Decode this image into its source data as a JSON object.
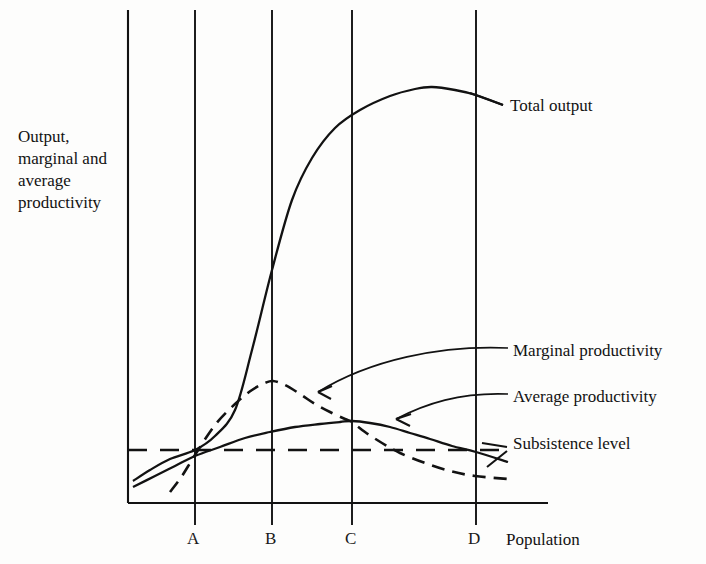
{
  "figure": {
    "axis_y_label": "Output,\nmarginal and\naverage\nproductivity",
    "axis_x_label": "Population",
    "background_color": "#fdfdfc",
    "ink_color": "#121212"
  },
  "labels": {
    "total_output": "Total output",
    "marginal_productivity": "Marginal productivity",
    "average_productivity": "Average productivity",
    "subsistence_level": "Subsistence level"
  },
  "ticks": {
    "a": "A",
    "b": "B",
    "c": "C",
    "d": "D"
  },
  "chart_data": {
    "type": "line",
    "title": "",
    "xlabel": "Population",
    "ylabel": "Output, marginal and average productivity",
    "grid": true,
    "legend": "right-inline-callouts",
    "x_tick_labels": [
      "A",
      "B",
      "C",
      "D"
    ],
    "x_tick_pixels": [
      195,
      272,
      352,
      476
    ],
    "y_tick_labels": [],
    "axis_origin_px": [
      128,
      503
    ],
    "axis_x_end_px": [
      548,
      503
    ],
    "axis_y_top_px": [
      128,
      10
    ],
    "annotations": [
      {
        "text": "Total output",
        "anchor_px": [
          503,
          105
        ]
      },
      {
        "text": "Marginal productivity",
        "anchor_px": [
          313,
          393
        ]
      },
      {
        "text": "Average productivity",
        "anchor_px": [
          392,
          420
        ]
      },
      {
        "text": "Subsistence level",
        "anchor_px": [
          505,
          450
        ]
      }
    ],
    "series": [
      {
        "name": "Total output",
        "style": "solid",
        "description": "S-shaped curve: rises slowly, inflects at B, peaks just before D, then declines",
        "points": [
          [
            133,
            481
          ],
          [
            150,
            470
          ],
          [
            170,
            459
          ],
          [
            195,
            450
          ],
          [
            215,
            436
          ],
          [
            235,
            410
          ],
          [
            252,
            350
          ],
          [
            272,
            270
          ],
          [
            292,
            200
          ],
          [
            312,
            158
          ],
          [
            335,
            128
          ],
          [
            360,
            110
          ],
          [
            390,
            96
          ],
          [
            415,
            89
          ],
          [
            432,
            87
          ],
          [
            455,
            90
          ],
          [
            476,
            95
          ],
          [
            503,
            105
          ]
        ]
      },
      {
        "name": "Marginal productivity",
        "style": "dashed",
        "description": "Rises steeply from below subsistence, peaks at B, falls and crosses Average at C, continues down",
        "points": [
          [
            170,
            492
          ],
          [
            182,
            476
          ],
          [
            195,
            455
          ],
          [
            215,
            425
          ],
          [
            235,
            404
          ],
          [
            252,
            390
          ],
          [
            265,
            383
          ],
          [
            273,
            381
          ],
          [
            285,
            385
          ],
          [
            300,
            394
          ],
          [
            315,
            404
          ],
          [
            330,
            412
          ],
          [
            345,
            419
          ],
          [
            352,
            422
          ],
          [
            365,
            432
          ],
          [
            382,
            443
          ],
          [
            400,
            453
          ],
          [
            425,
            463
          ],
          [
            450,
            471
          ],
          [
            475,
            476
          ],
          [
            508,
            479
          ]
        ]
      },
      {
        "name": "Average productivity",
        "style": "solid",
        "description": "Rises from below subsistence, crosses subsistence near A, peaks at C where Marginal cuts it, declines and crosses subsistence at D",
        "points": [
          [
            133,
            487
          ],
          [
            155,
            476
          ],
          [
            175,
            466
          ],
          [
            195,
            456
          ],
          [
            220,
            447
          ],
          [
            245,
            438
          ],
          [
            270,
            432
          ],
          [
            295,
            427
          ],
          [
            320,
            424
          ],
          [
            340,
            422
          ],
          [
            352,
            421
          ],
          [
            370,
            423
          ],
          [
            390,
            427
          ],
          [
            410,
            433
          ],
          [
            430,
            439
          ],
          [
            452,
            446
          ],
          [
            476,
            452
          ],
          [
            508,
            462
          ]
        ]
      },
      {
        "name": "Subsistence level",
        "style": "dashed-horizontal",
        "description": "Horizontal dashed reference line",
        "points": [
          [
            128,
            450
          ],
          [
            505,
            450
          ]
        ]
      }
    ],
    "vertical_gridlines_px": [
      128,
      195,
      272,
      352,
      476
    ]
  }
}
